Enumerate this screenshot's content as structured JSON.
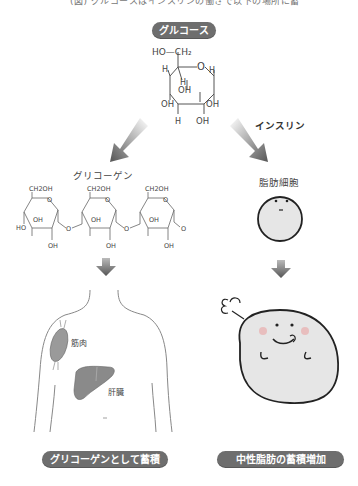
{
  "header": {
    "caption_cropped": "(図) グルコースはインスリンの働きで以下の場所に蓄えられる"
  },
  "glucose": {
    "badge_label": "グルコース",
    "structure_labels": {
      "ch2": "HO—CH₂",
      "ring_o": "O",
      "h_top_left": "H",
      "h_top_inner": "H",
      "h_right": "H",
      "oh_center": "OH",
      "oh_left": "OH",
      "oh_right": "OH",
      "h_bottom": "H",
      "oh_bottom": "OH"
    }
  },
  "insulin": {
    "label": "インスリン"
  },
  "left_branch": {
    "title": "グリコーゲン",
    "chain_units": [
      {
        "ch2oh": "CH2OH",
        "oh_inner": "OH",
        "oh_bottom": "OH",
        "ho_left": "HO",
        "link": "O"
      },
      {
        "ch2oh": "CH2OH",
        "oh_inner": "OH",
        "oh_bottom": "OH",
        "link": "O"
      },
      {
        "ch2oh": "CH2OH",
        "oh_inner": "OH",
        "oh_bottom": "OH",
        "link": "O"
      }
    ],
    "body_labels": {
      "muscle": "筋肉",
      "liver": "肝臓"
    },
    "result_badge": "グリコーゲンとして蓄積"
  },
  "right_branch": {
    "title": "脂肪細胞",
    "result_badge": "中性脂肪の蓄積増加"
  },
  "colors": {
    "badge_bg": "#6e6e6e",
    "badge_text": "#ffffff",
    "arrow_dark": "#555555",
    "cell_fill": "#e6e6e6",
    "cell_stroke": "#222222",
    "cheek": "#e8b4b4",
    "liver": "#8a8a8a",
    "muscle": "#9a9a9a",
    "outline": "#888888"
  }
}
